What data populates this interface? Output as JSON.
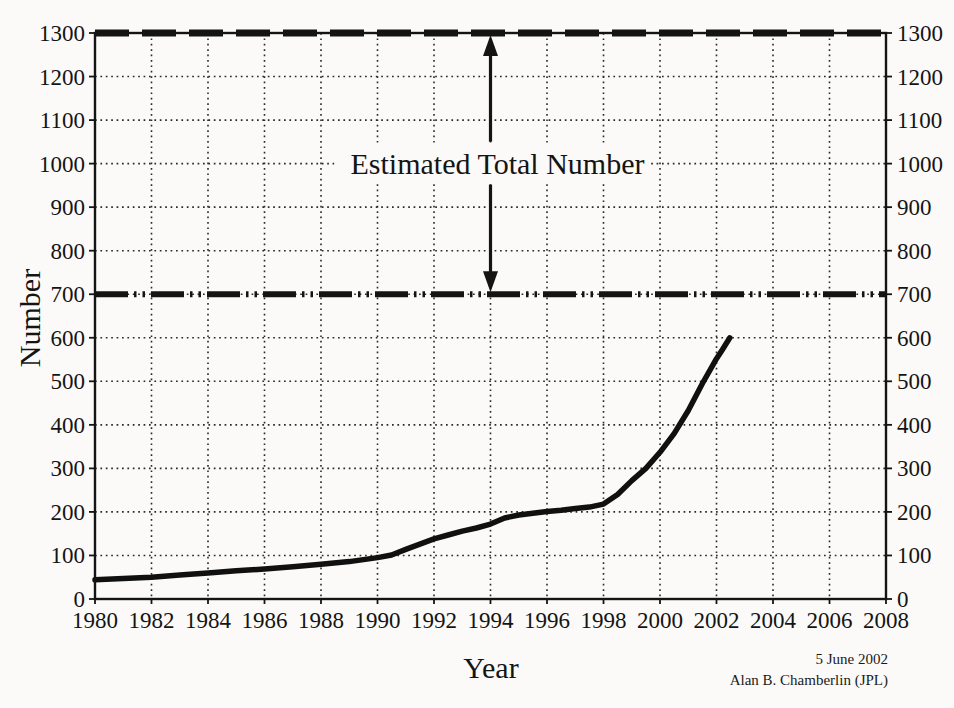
{
  "figure": {
    "background": "#fbfaf8",
    "ink": "#141414"
  },
  "chart_data": {
    "type": "line",
    "title": "",
    "xlabel": "Year",
    "ylabel": "Number",
    "xlim": [
      1980,
      2008
    ],
    "ylim": [
      0,
      1300
    ],
    "x_ticks": [
      1980,
      1982,
      1984,
      1986,
      1988,
      1990,
      1992,
      1994,
      1996,
      1998,
      2000,
      2002,
      2004,
      2006,
      2008
    ],
    "y_ticks": [
      0,
      100,
      200,
      300,
      400,
      500,
      600,
      700,
      800,
      900,
      1000,
      1100,
      1200,
      1300
    ],
    "grid": "dotted",
    "legend": "none",
    "series": [
      {
        "points": [
          [
            1980,
            44
          ],
          [
            1981,
            47
          ],
          [
            1982,
            50
          ],
          [
            1983,
            55
          ],
          [
            1984,
            60
          ],
          [
            1985,
            65
          ],
          [
            1986,
            69
          ],
          [
            1987,
            74
          ],
          [
            1988,
            80
          ],
          [
            1989,
            86
          ],
          [
            1990,
            95
          ],
          [
            1990.5,
            101
          ],
          [
            1991,
            114
          ],
          [
            1991.5,
            126
          ],
          [
            1992,
            138
          ],
          [
            1992.5,
            147
          ],
          [
            1993,
            156
          ],
          [
            1993.5,
            163
          ],
          [
            1994,
            172
          ],
          [
            1994.5,
            186
          ],
          [
            1995,
            193
          ],
          [
            1995.5,
            197
          ],
          [
            1996,
            201
          ],
          [
            1996.5,
            204
          ],
          [
            1997,
            208
          ],
          [
            1997.5,
            211
          ],
          [
            1998,
            218
          ],
          [
            1998.5,
            240
          ],
          [
            1999,
            272
          ],
          [
            1999.5,
            300
          ],
          [
            2000,
            337
          ],
          [
            2000.5,
            380
          ],
          [
            2001,
            433
          ],
          [
            2001.5,
            495
          ],
          [
            2002,
            552
          ],
          [
            2002.2,
            572
          ],
          [
            2002.47,
            600
          ]
        ]
      }
    ],
    "reference_lines": [
      {
        "value": 700,
        "style": "thick-dash-dot-dot"
      },
      {
        "value": 1300,
        "style": "thick-dash"
      }
    ],
    "annotation": {
      "label": "Estimated Total Number",
      "from": 700,
      "to": 1300,
      "arrow_x": 1994
    }
  },
  "footer": {
    "date": "5 June 2002",
    "credit": "Alan B. Chamberlin (JPL)"
  }
}
